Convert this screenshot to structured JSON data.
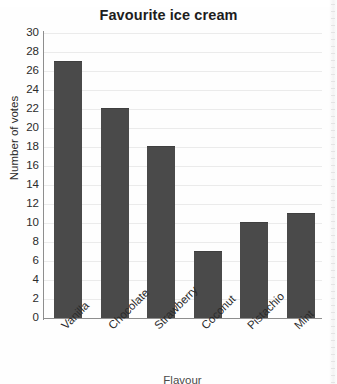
{
  "chart_data": {
    "type": "bar",
    "title": "Favourite ice cream",
    "xlabel": "Flavour",
    "ylabel": "Number of votes",
    "categories": [
      "Vanilla",
      "Chocolate",
      "Strawberry",
      "Coconut",
      "Pistachio",
      "Mint"
    ],
    "values": [
      27,
      22,
      18,
      7,
      10,
      11
    ],
    "ylim": [
      0,
      30
    ],
    "ytick_step": 2,
    "yticks": [
      30,
      28,
      26,
      24,
      22,
      20,
      18,
      16,
      14,
      12,
      10,
      8,
      6,
      4,
      2,
      0
    ],
    "grid": true,
    "legend": false,
    "bar_color": "#4a4a4a",
    "gridline_color": "#ebebeb",
    "axis_color": "#8e8e8e",
    "xtick_rotation": -45
  }
}
